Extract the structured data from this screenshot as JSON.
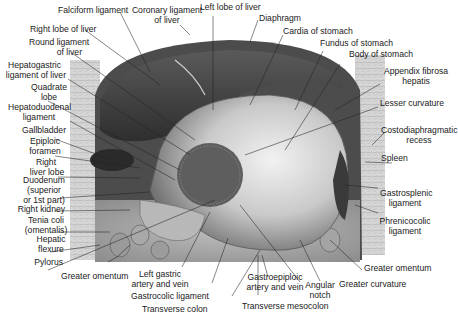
{
  "figure": {
    "labels_left": [
      {
        "id": "falciform",
        "text": "Falciform ligament"
      },
      {
        "id": "right_lobe",
        "text": "Right lobe of liver"
      },
      {
        "id": "round_lig_1",
        "text": "Round ligament"
      },
      {
        "id": "round_lig_2",
        "text": "of liver"
      },
      {
        "id": "hepatogastric_1",
        "text": "Hepatogastric"
      },
      {
        "id": "hepatogastric_2",
        "text": "ligament of liver"
      },
      {
        "id": "quadrate_1",
        "text": "Quadrate"
      },
      {
        "id": "quadrate_2",
        "text": "lobe"
      },
      {
        "id": "hepatoduodenal_1",
        "text": "Hepatoduodenal"
      },
      {
        "id": "hepatoduodenal_2",
        "text": "ligament"
      },
      {
        "id": "gallbladder",
        "text": "Gallbladder"
      },
      {
        "id": "epiploic_1",
        "text": "Epiploic"
      },
      {
        "id": "epiploic_2",
        "text": "foramen"
      },
      {
        "id": "right_liver_1",
        "text": "Right"
      },
      {
        "id": "right_liver_2",
        "text": "liver lobe"
      },
      {
        "id": "duodenum_1",
        "text": "Duodenum"
      },
      {
        "id": "duodenum_2",
        "text": "(superior"
      },
      {
        "id": "duodenum_3",
        "text": "or 1st part)"
      },
      {
        "id": "right_kidney",
        "text": "Right kidney"
      },
      {
        "id": "tenia_1",
        "text": "Tenia coli"
      },
      {
        "id": "tenia_2",
        "text": "(omentalis)"
      },
      {
        "id": "hepatic_1",
        "text": "Hepatic"
      },
      {
        "id": "hepatic_2",
        "text": "flexure"
      },
      {
        "id": "pylorus",
        "text": "Pylorus"
      }
    ],
    "labels_top": [
      {
        "id": "coronary_1",
        "text": "Coronary ligament"
      },
      {
        "id": "coronary_2",
        "text": "of liver"
      },
      {
        "id": "left_lobe",
        "text": "Left lobe of liver"
      },
      {
        "id": "diaphragm",
        "text": "Diaphragm"
      },
      {
        "id": "cardia",
        "text": "Cardia of stomach"
      },
      {
        "id": "fundus",
        "text": "Fundus of stomach"
      },
      {
        "id": "body",
        "text": "Body of stomach"
      }
    ],
    "labels_right": [
      {
        "id": "appendix_1",
        "text": "Appendix fibrosa"
      },
      {
        "id": "appendix_2",
        "text": "hepatis"
      },
      {
        "id": "lesser_curv",
        "text": "Lesser curvature"
      },
      {
        "id": "costo_1",
        "text": "Costodiaphragmatic"
      },
      {
        "id": "costo_2",
        "text": "recess"
      },
      {
        "id": "spleen",
        "text": "Spleen"
      },
      {
        "id": "gastrosplenic_1",
        "text": "Gastrosplenic"
      },
      {
        "id": "gastrosplenic_2",
        "text": "ligament"
      },
      {
        "id": "phrenicocolic_1",
        "text": "Phrenicocolic"
      },
      {
        "id": "phrenicocolic_2",
        "text": "ligament"
      },
      {
        "id": "greater_omentum_r",
        "text": "Greater omentum"
      }
    ],
    "labels_bottom": [
      {
        "id": "greater_omentum_l",
        "text": "Greater omentum"
      },
      {
        "id": "left_gastric_1",
        "text": "Left gastric"
      },
      {
        "id": "left_gastric_2",
        "text": "artery and vein"
      },
      {
        "id": "gastrocolic",
        "text": "Gastrocolic ligament"
      },
      {
        "id": "transverse_colon",
        "text": "Transverse colon"
      },
      {
        "id": "gastroepiploic_1",
        "text": "Gastroepiploic"
      },
      {
        "id": "gastroepiploic_2",
        "text": "artery and vein"
      },
      {
        "id": "angular_1",
        "text": "Angular"
      },
      {
        "id": "angular_2",
        "text": "notch"
      },
      {
        "id": "transverse_mesocolon",
        "text": "Transverse mesocolon"
      },
      {
        "id": "greater_curv",
        "text": "Greater curvature"
      }
    ]
  },
  "colors": {
    "background": "#ffffff",
    "tissue_dark": "#3a3a3a",
    "tissue_mid": "#8a8a8a",
    "tissue_light": "#d9d9d9",
    "leader_line": "#222222"
  }
}
